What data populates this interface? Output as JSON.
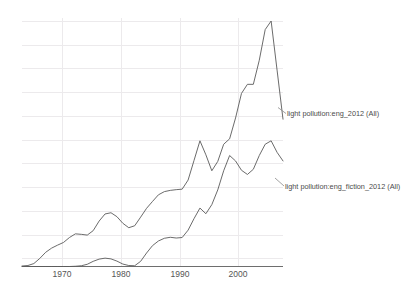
{
  "chart_data": {
    "type": "line",
    "title": "",
    "subtitle": "",
    "xlabel": "",
    "ylabel": "",
    "grid": true,
    "legend_position": "inline-right",
    "xlim": [
      1964,
      2008
    ],
    "ylim": [
      0,
      2.15e-06
    ],
    "xticks": [
      1970,
      1980,
      1990,
      2000
    ],
    "xticklabels": [
      "1970",
      "1980",
      "1990",
      "2000"
    ],
    "yticks": [],
    "yticklabels": [],
    "annotations": [
      "light pollution:eng_2012 (All)",
      "light pollution:eng_fiction_2012 (All)"
    ],
    "x": [
      1964,
      1965,
      1966,
      1967,
      1968,
      1969,
      1970,
      1971,
      1972,
      1973,
      1974,
      1975,
      1976,
      1977,
      1978,
      1979,
      1980,
      1981,
      1982,
      1983,
      1984,
      1985,
      1986,
      1987,
      1988,
      1989,
      1990,
      1991,
      1992,
      1993,
      1994,
      1995,
      1996,
      1997,
      1998,
      1999,
      2000,
      2001,
      2002,
      2003,
      2004,
      2005,
      2006,
      2007,
      2008
    ],
    "series": [
      {
        "name": "light pollution:eng_2012 (All)",
        "color": "#5a5a5a",
        "values": [
          0.002,
          0.004,
          0.012,
          0.033,
          0.058,
          0.075,
          0.087,
          0.098,
          0.118,
          0.133,
          0.131,
          0.128,
          0.146,
          0.185,
          0.214,
          0.219,
          0.203,
          0.176,
          0.158,
          0.166,
          0.201,
          0.237,
          0.265,
          0.292,
          0.305,
          0.31,
          0.313,
          0.315,
          0.352,
          0.432,
          0.512,
          0.455,
          0.39,
          0.428,
          0.498,
          0.52,
          0.605,
          0.705,
          0.742,
          0.742,
          0.84,
          0.965,
          1.0,
          0.8,
          0.6
        ]
      },
      {
        "name": "light pollution:eng_fiction_2012 (All)",
        "color": "#5a5a5a",
        "values": [
          0.0,
          0.0,
          0.0,
          0.0,
          0.0,
          0.0,
          0.0,
          0.0,
          0.0,
          0.001,
          0.003,
          0.009,
          0.021,
          0.03,
          0.034,
          0.031,
          0.022,
          0.01,
          0.004,
          0.003,
          0.021,
          0.055,
          0.085,
          0.104,
          0.115,
          0.119,
          0.116,
          0.118,
          0.148,
          0.195,
          0.238,
          0.215,
          0.252,
          0.312,
          0.39,
          0.452,
          0.43,
          0.392,
          0.375,
          0.396,
          0.452,
          0.498,
          0.512,
          0.465,
          0.43
        ]
      }
    ]
  },
  "axis": {
    "tick_1970": "1970",
    "tick_1980": "1980",
    "tick_1990": "1990",
    "tick_2000": "2000"
  },
  "labels": {
    "series_1": "light pollution:eng_2012 (All)",
    "series_2": "light pollution:eng_fiction_2012 (All)"
  },
  "colors": {
    "background": "#ffffff",
    "gridline": "#eceaec",
    "axis": "#6e6e6e",
    "line": "#5a5a5a",
    "text": "#4a4a4a"
  }
}
